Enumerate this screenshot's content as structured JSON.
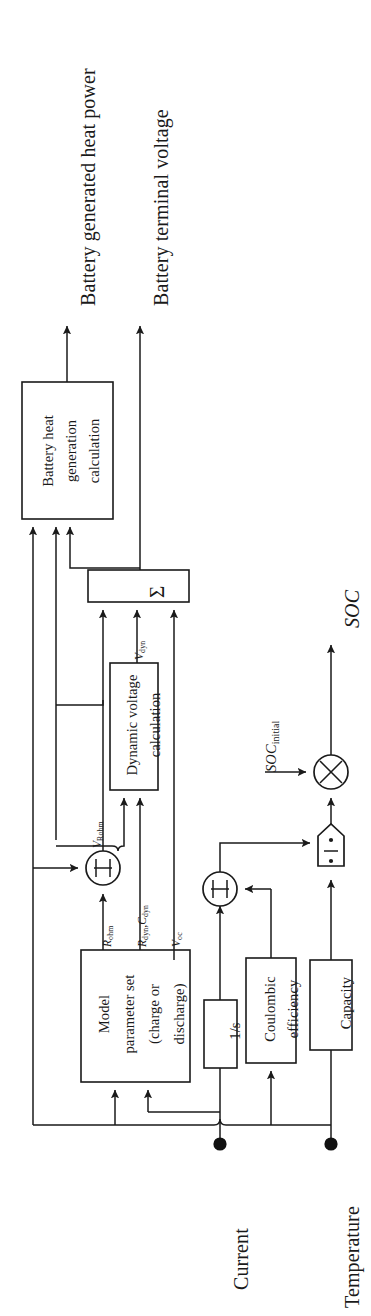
{
  "figure": {
    "orientation": "rotated-90-ccw",
    "background_color": "#ffffff",
    "line_color": "#1a1a1a"
  },
  "outputs": {
    "heat_power": "Battery generated heat power",
    "terminal_voltage": "Battery terminal voltage",
    "soc": "SOC"
  },
  "inputs": {
    "current": "Current",
    "temperature": "Temperature",
    "soc_initial_prefix": "SOC",
    "soc_initial_sub": "initial"
  },
  "blocks": {
    "heat_generation": {
      "line1": "Battery heat",
      "line2": "generation",
      "line3": "calculation"
    },
    "summation": {
      "glyph": "sum-sigma",
      "label": "Σ"
    },
    "dynamic_voltage": {
      "line1": "Dynamic voltage",
      "line2": "calculation"
    },
    "model_parameter_set": {
      "line1": "Model",
      "line2": "parameter set",
      "line3": "(charge or",
      "line4": "discharge)"
    },
    "integrator": {
      "label": "1/s"
    },
    "coulombic_efficiency": {
      "line1": "Coulombic",
      "line2": "efficiency"
    },
    "capacity": {
      "label": "Capacity"
    },
    "multiplier_rohm": {
      "glyph": "pi-product",
      "label": "Π"
    },
    "multiplier_charge": {
      "glyph": "pi-product",
      "label": "Π"
    },
    "divider_soc": {
      "glyph": "divide"
    },
    "adder_soc": {
      "glyph": "cross-multiply"
    }
  },
  "signals": {
    "v_rohm": {
      "base": "V",
      "sub": "Rohm"
    },
    "r_ohm": {
      "base": "R",
      "sub": "ohm"
    },
    "r_dyn_c_dyn": {
      "base1": "R",
      "sub1": "dyn",
      "sep": ",",
      "base2": "C",
      "sub2": "dyn"
    },
    "v_oc": {
      "base": "V",
      "sub": "oc"
    },
    "v_dyn": {
      "base": "V",
      "sub": "dyn"
    }
  }
}
